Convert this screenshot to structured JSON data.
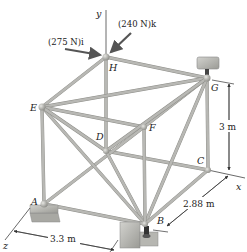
{
  "figure": {
    "type": "space-truss"
  },
  "axes": {
    "x": "x",
    "y": "y",
    "z": "z"
  },
  "joints": {
    "A": "A",
    "B": "B",
    "C": "C",
    "D": "D",
    "E": "E",
    "F": "F",
    "G": "G",
    "H": "H"
  },
  "loads": {
    "force_i": "(275 N)i",
    "force_k": "(240 N)k"
  },
  "dimensions": {
    "height": "3 m",
    "depth": "2.88 m",
    "width": "3.3 m"
  },
  "colors": {
    "member": "#b8b8b4",
    "member_edge": "#8d8d88",
    "joint": "#a9a9a4",
    "support": "#b0b0ab",
    "force_arrow": "#555555"
  }
}
